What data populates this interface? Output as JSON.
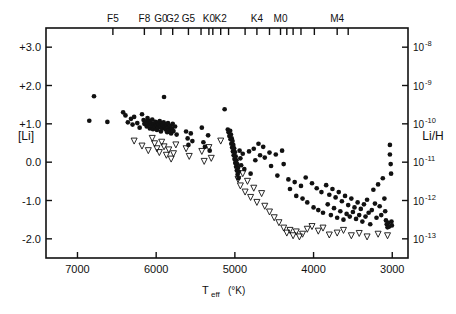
{
  "figure": {
    "title": "",
    "background_color": "#ffffff",
    "ink_color": "#111111"
  },
  "axes": {
    "left": {
      "label": "[Li]",
      "ticks": [
        "+3.0",
        "+2.0",
        "+1.0",
        "0.0",
        "-1.0",
        "-2.0"
      ],
      "values": [
        3.0,
        2.0,
        1.0,
        0.0,
        -1.0,
        -2.0
      ],
      "range": [
        -2.5,
        3.5
      ]
    },
    "right": {
      "label": "Li/H",
      "ticks": [
        "10⁻⁸",
        "10⁻⁹",
        "10⁻¹⁰",
        "10⁻¹¹",
        "10⁻¹²",
        "10⁻¹³"
      ],
      "mantissa": "10",
      "exponents": [
        "-8",
        "-9",
        "-10",
        "-11",
        "-12",
        "-13"
      ],
      "values": [
        3.0,
        2.0,
        1.0,
        0.0,
        -1.0,
        -2.0
      ]
    },
    "bottom": {
      "label_main": "T",
      "label_sub": "eff",
      "label_unit": "(°K)",
      "label_full": "T_eff (°K)",
      "ticks": [
        "7000",
        "6000",
        "5000",
        "4000",
        "3000"
      ],
      "values": [
        7000,
        6000,
        5000,
        4000,
        3000
      ],
      "range": [
        7400,
        2800
      ],
      "reversed": true
    },
    "top": {
      "label": "",
      "spectral_types": [
        {
          "label": "F5",
          "teff": 6550
        },
        {
          "label": "F8",
          "teff": 6150
        },
        {
          "label": "G0",
          "teff": 5940
        },
        {
          "label": "G2",
          "teff": 5790
        },
        {
          "label": "G5",
          "teff": 5590
        },
        {
          "label": "K0",
          "teff": 5330
        },
        {
          "label": "K2",
          "teff": 5180
        },
        {
          "label": "K4",
          "teff": 4720
        },
        {
          "label": "M0",
          "teff": 4420
        },
        {
          "label": "M4",
          "teff": 3700
        }
      ],
      "unlabeled_ticks_teff": [
        5430,
        5280,
        5080,
        4870,
        4560,
        4340,
        4260,
        4160,
        3990,
        3560
      ]
    }
  },
  "chart_data": {
    "type": "scatter",
    "title": "",
    "xlabel": "T_eff (°K)",
    "ylabel": "[Li]",
    "ylabel_right": "Li/H",
    "xlim": [
      7400,
      2800
    ],
    "ylim": [
      -2.5,
      3.5
    ],
    "grid": false,
    "legend": null,
    "x_reversed": true,
    "series": [
      {
        "name": "detections",
        "marker": "filled-circle",
        "marker_size": 3.4,
        "color": "#111111",
        "points": [
          [
            6790,
            1.72
          ],
          [
            6850,
            1.08
          ],
          [
            6620,
            1.05
          ],
          [
            6420,
            1.3
          ],
          [
            6390,
            1.22
          ],
          [
            6360,
            1.04
          ],
          [
            6320,
            1.13
          ],
          [
            6300,
            0.98
          ],
          [
            6280,
            1.18
          ],
          [
            6240,
            1.02
          ],
          [
            6210,
            0.9
          ],
          [
            6180,
            1.25
          ],
          [
            6160,
            1.1
          ],
          [
            6150,
            1.0
          ],
          [
            6130,
            1.06
          ],
          [
            6120,
            0.93
          ],
          [
            6110,
            1.15
          ],
          [
            6100,
            0.99
          ],
          [
            6090,
            1.08
          ],
          [
            6080,
            0.88
          ],
          [
            6070,
            1.02
          ],
          [
            6060,
            0.95
          ],
          [
            6050,
            1.11
          ],
          [
            6040,
            0.86
          ],
          [
            6030,
            1.0
          ],
          [
            6020,
            0.92
          ],
          [
            6010,
            1.05
          ],
          [
            6000,
            0.97
          ],
          [
            5990,
            0.84
          ],
          [
            5980,
            1.03
          ],
          [
            5975,
            0.9
          ],
          [
            5965,
            0.99
          ],
          [
            5955,
            1.07
          ],
          [
            5945,
            0.94
          ],
          [
            5940,
            0.8
          ],
          [
            5930,
            1.01
          ],
          [
            5925,
            0.88
          ],
          [
            5915,
            0.96
          ],
          [
            5905,
            1.04
          ],
          [
            5900,
            1.7
          ],
          [
            5890,
            0.92
          ],
          [
            5880,
            0.85
          ],
          [
            5870,
            0.98
          ],
          [
            5860,
            0.78
          ],
          [
            5850,
            1.02
          ],
          [
            5840,
            0.9
          ],
          [
            5830,
            0.83
          ],
          [
            5820,
            0.95
          ],
          [
            5810,
            0.75
          ],
          [
            5800,
            0.88
          ],
          [
            5790,
            1.0
          ],
          [
            5780,
            0.81
          ],
          [
            5760,
            0.93
          ],
          [
            5740,
            0.72
          ],
          [
            5620,
            0.8
          ],
          [
            5600,
            0.62
          ],
          [
            5590,
            0.45
          ],
          [
            5560,
            0.75
          ],
          [
            5540,
            0.55
          ],
          [
            5420,
            0.9
          ],
          [
            5400,
            0.52
          ],
          [
            5380,
            0.4
          ],
          [
            5340,
            0.7
          ],
          [
            5320,
            0.3
          ],
          [
            5130,
            1.38
          ],
          [
            5090,
            0.85
          ],
          [
            5080,
            0.78
          ],
          [
            5070,
            0.68
          ],
          [
            5060,
            0.82
          ],
          [
            5055,
            0.6
          ],
          [
            5050,
            0.72
          ],
          [
            5045,
            0.48
          ],
          [
            5040,
            0.62
          ],
          [
            5035,
            0.38
          ],
          [
            5030,
            0.55
          ],
          [
            5025,
            0.28
          ],
          [
            5020,
            0.45
          ],
          [
            5015,
            0.18
          ],
          [
            5010,
            0.36
          ],
          [
            5005,
            0.08
          ],
          [
            5000,
            0.26
          ],
          [
            4995,
            -0.02
          ],
          [
            4990,
            0.15
          ],
          [
            4985,
            -0.12
          ],
          [
            4980,
            0.05
          ],
          [
            4975,
            -0.22
          ],
          [
            4970,
            -0.05
          ],
          [
            4965,
            -0.32
          ],
          [
            4960,
            -0.15
          ],
          [
            4955,
            -0.42
          ],
          [
            4950,
            -0.25
          ],
          [
            4940,
            0.3
          ],
          [
            4930,
            0.1
          ],
          [
            4920,
            -0.08
          ],
          [
            4900,
            0.22
          ],
          [
            4880,
            -0.18
          ],
          [
            4820,
            0.28
          ],
          [
            4800,
            -0.3
          ],
          [
            4760,
            0.35
          ],
          [
            4740,
            0.05
          ],
          [
            4700,
            0.48
          ],
          [
            4680,
            0.18
          ],
          [
            4640,
            0.4
          ],
          [
            4620,
            0.12
          ],
          [
            4560,
            0.25
          ],
          [
            4540,
            -0.1
          ],
          [
            4480,
            0.2
          ],
          [
            4460,
            -0.35
          ],
          [
            4400,
            0.3
          ],
          [
            4380,
            -0.05
          ],
          [
            4320,
            -0.45
          ],
          [
            4300,
            -0.7
          ],
          [
            4240,
            -0.52
          ],
          [
            4220,
            -0.88
          ],
          [
            4160,
            -0.62
          ],
          [
            4140,
            -0.95
          ],
          [
            4100,
            -0.4
          ],
          [
            4080,
            -1.05
          ],
          [
            4020,
            -0.55
          ],
          [
            4000,
            -1.18
          ],
          [
            3960,
            -0.68
          ],
          [
            3940,
            -1.25
          ],
          [
            3900,
            -0.78
          ],
          [
            3880,
            -1.32
          ],
          [
            3840,
            -0.6
          ],
          [
            3820,
            -1.1
          ],
          [
            3800,
            -0.85
          ],
          [
            3780,
            -1.38
          ],
          [
            3760,
            -0.7
          ],
          [
            3740,
            -1.2
          ],
          [
            3720,
            -0.92
          ],
          [
            3700,
            -1.45
          ],
          [
            3680,
            -0.78
          ],
          [
            3660,
            -1.28
          ],
          [
            3640,
            -1.02
          ],
          [
            3620,
            -1.5
          ],
          [
            3600,
            -0.88
          ],
          [
            3580,
            -1.35
          ],
          [
            3560,
            -1.12
          ],
          [
            3540,
            -1.42
          ],
          [
            3520,
            -0.95
          ],
          [
            3500,
            -1.3
          ],
          [
            3480,
            -1.18
          ],
          [
            3460,
            -1.48
          ],
          [
            3440,
            -1.05
          ],
          [
            3420,
            -1.38
          ],
          [
            3400,
            -1.22
          ],
          [
            3380,
            -1.55
          ],
          [
            3360,
            -1.1
          ],
          [
            3340,
            -1.42
          ],
          [
            3320,
            -0.98
          ],
          [
            3300,
            -1.32
          ],
          [
            3280,
            -1.62
          ],
          [
            3260,
            -1.25
          ],
          [
            3240,
            -0.72
          ],
          [
            3220,
            -1.08
          ],
          [
            3200,
            -1.45
          ],
          [
            3180,
            -0.58
          ],
          [
            3160,
            -1.15
          ],
          [
            3140,
            -1.38
          ],
          [
            3120,
            -0.42
          ],
          [
            3100,
            -0.95
          ],
          [
            3090,
            -1.28
          ],
          [
            3080,
            -1.52
          ],
          [
            3070,
            -1.62
          ],
          [
            3060,
            -1.7
          ],
          [
            3050,
            -1.58
          ],
          [
            3040,
            -1.68
          ],
          [
            3030,
            0.45
          ],
          [
            3030,
            0.2
          ],
          [
            3020,
            -0.05
          ],
          [
            3015,
            -0.3
          ],
          [
            3010,
            -1.55
          ],
          [
            3005,
            -1.65
          ]
        ]
      },
      {
        "name": "upper-limits",
        "marker": "down-triangle",
        "marker_size": 3.0,
        "color": "#111111",
        "points": [
          [
            6280,
            0.55
          ],
          [
            6180,
            0.42
          ],
          [
            6100,
            0.3
          ],
          [
            6050,
            0.62
          ],
          [
            6020,
            0.48
          ],
          [
            5990,
            0.35
          ],
          [
            5960,
            0.25
          ],
          [
            5930,
            0.52
          ],
          [
            5900,
            0.4
          ],
          [
            5870,
            0.18
          ],
          [
            5840,
            0.32
          ],
          [
            5810,
            0.08
          ],
          [
            5780,
            0.22
          ],
          [
            5750,
            0.45
          ],
          [
            5620,
            0.35
          ],
          [
            5580,
            0.15
          ],
          [
            5420,
            0.28
          ],
          [
            5390,
            0.02
          ],
          [
            5330,
            0.38
          ],
          [
            5300,
            0.1
          ],
          [
            5180,
            0.55
          ],
          [
            4960,
            -0.45
          ],
          [
            4930,
            -0.62
          ],
          [
            4900,
            -0.3
          ],
          [
            4870,
            -0.78
          ],
          [
            4840,
            -0.5
          ],
          [
            4800,
            -0.92
          ],
          [
            4760,
            -0.68
          ],
          [
            4720,
            -1.05
          ],
          [
            4660,
            -0.82
          ],
          [
            4620,
            -1.15
          ],
          [
            4560,
            -1.3
          ],
          [
            4500,
            -1.45
          ],
          [
            4440,
            -1.58
          ],
          [
            4380,
            -1.72
          ],
          [
            4340,
            -1.85
          ],
          [
            4300,
            -1.78
          ],
          [
            4260,
            -1.92
          ],
          [
            4220,
            -1.82
          ],
          [
            4180,
            -1.95
          ],
          [
            4140,
            -1.88
          ],
          [
            4080,
            -1.75
          ],
          [
            4020,
            -1.68
          ],
          [
            3940,
            -1.8
          ],
          [
            3880,
            -1.72
          ],
          [
            3800,
            -1.9
          ],
          [
            3700,
            -1.85
          ],
          [
            3620,
            -1.78
          ],
          [
            3520,
            -1.92
          ],
          [
            3420,
            -1.86
          ],
          [
            3320,
            -1.95
          ],
          [
            3180,
            -1.88
          ],
          [
            3060,
            -1.92
          ]
        ]
      }
    ]
  }
}
